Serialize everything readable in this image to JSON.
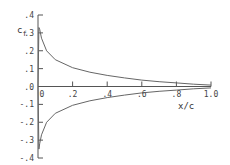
{
  "chart_data": {
    "type": "line",
    "title": "",
    "xlabel": "x/c",
    "ylabel": "c_f",
    "xlim": [
      0,
      1.0
    ],
    "ylim": [
      -0.4,
      0.4
    ],
    "grid": false,
    "x_ticks": [
      ".2",
      ".4",
      ".6",
      ".8",
      "1.0"
    ],
    "x_zero_label": "0",
    "y_ticks": [
      ".4",
      ".3",
      ".2",
      ".1",
      ".0",
      "-.1",
      "-.2",
      "-.3",
      "-.4"
    ],
    "series": [
      {
        "name": "upper surface",
        "x": [
          0.0,
          0.005,
          0.01,
          0.02,
          0.05,
          0.1,
          0.2,
          0.3,
          0.4,
          0.5,
          0.6,
          0.7,
          0.8,
          0.9,
          1.0
        ],
        "values": [
          0.0,
          0.33,
          0.32,
          0.27,
          0.2,
          0.15,
          0.105,
          0.08,
          0.062,
          0.048,
          0.036,
          0.027,
          0.02,
          0.013,
          0.008
        ]
      },
      {
        "name": "lower surface",
        "x": [
          0.0,
          0.005,
          0.01,
          0.02,
          0.05,
          0.1,
          0.2,
          0.3,
          0.4,
          0.5,
          0.6,
          0.7,
          0.8,
          0.9,
          1.0
        ],
        "values": [
          0.0,
          -0.35,
          -0.32,
          -0.27,
          -0.2,
          -0.15,
          -0.105,
          -0.08,
          -0.062,
          -0.048,
          -0.036,
          -0.027,
          -0.02,
          -0.013,
          -0.008
        ]
      }
    ]
  },
  "labels": {
    "ylabel_main": "c",
    "ylabel_sub": "f",
    "xlabel": "x/c"
  }
}
